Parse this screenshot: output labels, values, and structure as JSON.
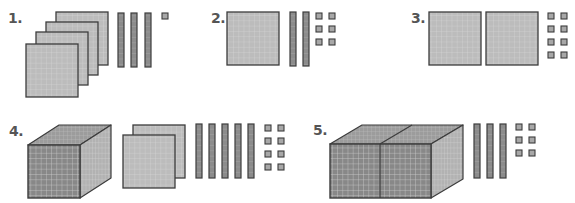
{
  "worksheet": {
    "title": "Base-ten blocks",
    "colors": {
      "outline": "#3c3c3c",
      "flat_fill": "#bcbcbc",
      "flat_grid": "#d8d8d8",
      "rod_fill": "#8c8c8c",
      "rod_grid": "#b4b4b4",
      "unit_fill": "#a8a8a8",
      "cube_front": "#888888",
      "cube_top": "#9c9c9c",
      "cube_side": "#b2b2b2",
      "cube_grid": "#d0d0d0",
      "label": "#555555"
    },
    "items": [
      {
        "label": "1.",
        "label_pos": [
          8,
          11
        ],
        "thousands": 0,
        "hundreds": 4,
        "tens": 3,
        "ones": 1,
        "cubes": [],
        "flats": [
          [
            56,
            12
          ],
          [
            46,
            22
          ],
          [
            36,
            32
          ],
          [
            26,
            44
          ]
        ],
        "rods": [
          [
            118,
            13
          ],
          [
            131,
            13
          ],
          [
            145,
            13
          ]
        ],
        "units": [
          [
            162,
            13
          ]
        ]
      },
      {
        "label": "2.",
        "label_pos": [
          211,
          11
        ],
        "thousands": 0,
        "hundreds": 1,
        "tens": 2,
        "ones": 6,
        "cubes": [],
        "flats": [
          [
            227,
            12
          ]
        ],
        "rods": [
          [
            290,
            12
          ],
          [
            303,
            12
          ]
        ],
        "units": [
          [
            316,
            13
          ],
          [
            329,
            13
          ],
          [
            316,
            26
          ],
          [
            329,
            26
          ],
          [
            316,
            39
          ],
          [
            329,
            39
          ]
        ]
      },
      {
        "label": "3.",
        "label_pos": [
          411,
          11
        ],
        "thousands": 0,
        "hundreds": 2,
        "tens": 0,
        "ones": 8,
        "cubes": [],
        "flats": [
          [
            429,
            12
          ],
          [
            486,
            12
          ]
        ],
        "rods": [],
        "units": [
          [
            548,
            13
          ],
          [
            561,
            13
          ],
          [
            548,
            26
          ],
          [
            561,
            26
          ],
          [
            548,
            39
          ],
          [
            561,
            39
          ],
          [
            548,
            52
          ],
          [
            561,
            52
          ]
        ]
      },
      {
        "label": "4.",
        "label_pos": [
          9,
          124
        ],
        "thousands": 1,
        "hundreds": 2,
        "tens": 5,
        "ones": 8,
        "cubes": [
          {
            "x": 28,
            "y": 145,
            "w": 52,
            "h": 53,
            "dx": 31,
            "dy": 20
          }
        ],
        "flats": [
          [
            133,
            125
          ],
          [
            123,
            135
          ]
        ],
        "rods": [
          [
            196,
            124
          ],
          [
            209,
            124
          ],
          [
            222,
            124
          ],
          [
            235,
            124
          ],
          [
            248,
            124
          ]
        ],
        "units": [
          [
            265,
            125
          ],
          [
            278,
            125
          ],
          [
            265,
            138
          ],
          [
            278,
            138
          ],
          [
            265,
            151
          ],
          [
            278,
            151
          ],
          [
            265,
            164
          ],
          [
            278,
            164
          ]
        ]
      },
      {
        "label": "5.",
        "label_pos": [
          313,
          123
        ],
        "thousands": 2,
        "hundreds": 0,
        "tens": 3,
        "ones": 6,
        "cubes": [
          {
            "x": 330,
            "y": 144,
            "w": 101,
            "h": 54,
            "dx": 32,
            "dy": 19,
            "split": 380
          }
        ],
        "flats": [],
        "rods": [
          [
            474,
            124
          ],
          [
            487,
            124
          ],
          [
            500,
            124
          ]
        ],
        "units": [
          [
            516,
            124
          ],
          [
            529,
            124
          ],
          [
            516,
            137
          ],
          [
            529,
            137
          ],
          [
            516,
            150
          ],
          [
            529,
            150
          ]
        ]
      }
    ],
    "sizes": {
      "flat": [
        52,
        53
      ],
      "rod": [
        6,
        54
      ],
      "unit": [
        6,
        6
      ]
    }
  }
}
